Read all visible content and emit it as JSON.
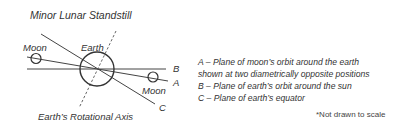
{
  "title": "Minor Lunar Standstill",
  "diagram": {
    "earth_label": "Earth",
    "moon_left_label": "Moon",
    "moon_right_label": "Moon",
    "axis_label": "Earth’s Rotational Axis",
    "line_labels": {
      "A": "A",
      "B": "B",
      "C": "C"
    },
    "colors": {
      "stroke": "#333333",
      "background": "#ffffff"
    }
  },
  "legend": [
    "A – Plane of moon’s orbit around the earth",
    "shown at two diametrically opposite positions",
    "B – Plane of earth’s orbit around the sun",
    "C – Plane of earth’s equator"
  ],
  "note": "*Not drawn to scale"
}
